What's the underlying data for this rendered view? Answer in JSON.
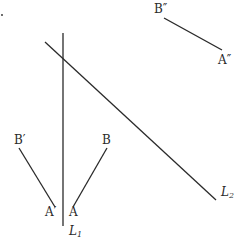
{
  "diagram": {
    "title": "",
    "lines": [
      {
        "id": "L1",
        "label": "L",
        "subscript": "1",
        "description": "vertical reflection line"
      },
      {
        "id": "L2",
        "label": "L",
        "subscript": "2",
        "description": "diagonal reflection line"
      }
    ],
    "segments": [
      {
        "id": "AB",
        "start_label": "A",
        "end_label": "B",
        "description": "original segment"
      },
      {
        "id": "A'B'",
        "start_label": "A′",
        "end_label": "B′",
        "description": "reflection of AB in L1"
      },
      {
        "id": "A''B''",
        "start_label": "A″",
        "end_label": "B″",
        "description": "reflection of A'B' in L2"
      }
    ],
    "labels": {
      "A": "A",
      "B": "B",
      "A_prime": "A′",
      "B_prime": "B′",
      "A_double_prime": "A″",
      "B_double_prime": "B″",
      "L1_main": "L",
      "L1_sub": "1",
      "L2_main": "L",
      "L2_sub": "2"
    },
    "colors": {
      "ink": "#2a2a2a",
      "background": "#ffffff"
    }
  }
}
